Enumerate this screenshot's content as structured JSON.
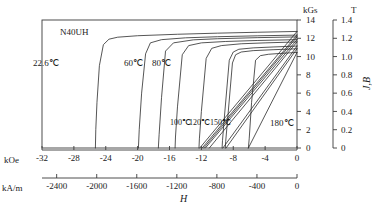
{
  "figure": {
    "sample_label": "N40UH",
    "x_axis_name": "H",
    "y_axis_name": "J,B",
    "unit_kgs": "kGs",
    "unit_tesla": "T",
    "unit_koe": "kOe",
    "unit_kam": "kA/m"
  },
  "axes": {
    "koe_ticks": [
      "-32",
      "-28",
      "-24",
      "-20",
      "-16",
      "-12",
      "-8",
      "-4",
      "0"
    ],
    "kam_ticks": [
      "-2400",
      "-2000",
      "-1600",
      "-1200",
      "-800",
      "-400",
      "0"
    ],
    "kgs_ticks": [
      "14",
      "12",
      "10",
      "8",
      "6",
      "4",
      "2",
      "0"
    ],
    "tesla_ticks": [
      "1.4",
      "1.2",
      "1.0",
      "0.8",
      "0.6",
      "0.4",
      "0.2",
      "0"
    ]
  },
  "curve_labels": [
    {
      "text": "22.6℃",
      "x": 33,
      "y": 59,
      "size": "big"
    },
    {
      "text": "60℃",
      "x": 124,
      "y": 59,
      "size": "big"
    },
    {
      "text": "80℃",
      "x": 152,
      "y": 59,
      "size": "big"
    },
    {
      "text": "100℃",
      "x": 170,
      "y": 119,
      "size": "small"
    },
    {
      "text": "120℃",
      "x": 189,
      "y": 119,
      "size": "small"
    },
    {
      "text": "150℃",
      "x": 210,
      "y": 119,
      "size": "small"
    },
    {
      "text": "180℃",
      "x": 270,
      "y": 119,
      "size": "big"
    }
  ],
  "chart_data": {
    "type": "line",
    "xlabel": "H",
    "ylabel": "J,B",
    "x_units": [
      "kOe",
      "kA/m"
    ],
    "y_units": [
      "kGs",
      "T"
    ],
    "xlim_koe": [
      -32,
      0
    ],
    "xlim_kam": [
      -2546,
      0
    ],
    "ylim_kgs": [
      0,
      14
    ],
    "ylim_tesla": [
      0,
      1.4
    ],
    "grid": false,
    "legend": "inline-annotations",
    "series": [
      {
        "name": "22.6℃ J",
        "kind": "J",
        "Br_kGs": 12.75,
        "Hcj_kOe": -25.3,
        "knee_kOe": -24.3,
        "points_koe_kgs": [
          [
            0,
            12.75
          ],
          [
            -5,
            12.66
          ],
          [
            -10,
            12.56
          ],
          [
            -15,
            12.44
          ],
          [
            -20,
            12.28
          ],
          [
            -22.5,
            12.12
          ],
          [
            -23.6,
            11.9
          ],
          [
            -24.3,
            11.3
          ],
          [
            -24.8,
            9.0
          ],
          [
            -25.1,
            5.0
          ],
          [
            -25.25,
            2.0
          ],
          [
            -25.3,
            0
          ]
        ]
      },
      {
        "name": "22.6℃ B",
        "kind": "B",
        "Br_kGs": 12.75,
        "Hcb_kOe": -12.2,
        "points_koe_kgs": [
          [
            0,
            12.75
          ],
          [
            -12.2,
            0
          ]
        ]
      },
      {
        "name": "60℃ J",
        "kind": "J",
        "Br_kGs": 12.35,
        "Hcj_kOe": -19.9,
        "knee_kOe": -19.0,
        "points_koe_kgs": [
          [
            0,
            12.35
          ],
          [
            -5,
            12.27
          ],
          [
            -10,
            12.17
          ],
          [
            -14,
            12.05
          ],
          [
            -17,
            11.85
          ],
          [
            -18.4,
            11.5
          ],
          [
            -19.0,
            10.3
          ],
          [
            -19.5,
            6.0
          ],
          [
            -19.8,
            2.0
          ],
          [
            -19.9,
            0
          ]
        ]
      },
      {
        "name": "60℃ B",
        "kind": "B",
        "Br_kGs": 12.35,
        "Hcb_kOe": -11.9,
        "points_koe_kgs": [
          [
            0,
            12.35
          ],
          [
            -11.9,
            0
          ]
        ]
      },
      {
        "name": "80℃ J",
        "kind": "J",
        "Br_kGs": 12.15,
        "Hcj_kOe": -17.4,
        "knee_kOe": -16.5,
        "points_koe_kgs": [
          [
            0,
            12.15
          ],
          [
            -5,
            12.07
          ],
          [
            -10,
            11.95
          ],
          [
            -13,
            11.83
          ],
          [
            -15.5,
            11.5
          ],
          [
            -16.5,
            10.6
          ],
          [
            -17.0,
            5.5
          ],
          [
            -17.3,
            1.5
          ],
          [
            -17.4,
            0
          ]
        ]
      },
      {
        "name": "80℃ B",
        "kind": "B",
        "Br_kGs": 12.15,
        "Hcb_kOe": -11.7,
        "points_koe_kgs": [
          [
            0,
            12.15
          ],
          [
            -11.7,
            0
          ]
        ]
      },
      {
        "name": "100℃ J",
        "kind": "J",
        "Br_kGs": 11.85,
        "Hcj_kOe": -15.3,
        "knee_kOe": -14.4,
        "points_koe_kgs": [
          [
            0,
            11.85
          ],
          [
            -5,
            11.76
          ],
          [
            -9,
            11.65
          ],
          [
            -12,
            11.5
          ],
          [
            -13.6,
            11.2
          ],
          [
            -14.4,
            10.2
          ],
          [
            -15.0,
            4.5
          ],
          [
            -15.25,
            1.2
          ],
          [
            -15.3,
            0
          ]
        ]
      },
      {
        "name": "100℃ B",
        "kind": "B",
        "Br_kGs": 11.85,
        "Hcb_kOe": -11.5,
        "points_koe_kgs": [
          [
            0,
            11.85
          ],
          [
            -11.5,
            0
          ]
        ]
      },
      {
        "name": "120℃ J",
        "kind": "J",
        "Br_kGs": 11.6,
        "Hcj_kOe": -12.3,
        "knee_kOe": -11.4,
        "points_koe_kgs": [
          [
            0,
            11.6
          ],
          [
            -4,
            11.5
          ],
          [
            -7,
            11.4
          ],
          [
            -9.5,
            11.2
          ],
          [
            -10.7,
            10.9
          ],
          [
            -11.4,
            9.8
          ],
          [
            -12.0,
            4.0
          ],
          [
            -12.25,
            1.0
          ],
          [
            -12.3,
            0
          ]
        ]
      },
      {
        "name": "120℃ B",
        "kind": "B",
        "Br_kGs": 11.6,
        "Hcb_kOe": -11.0,
        "points_koe_kgs": [
          [
            0,
            11.6
          ],
          [
            -11.0,
            0
          ]
        ]
      },
      {
        "name": "150℃ J",
        "kind": "J",
        "Br_kGs": 11.15,
        "Hcj_kOe": -9.4,
        "knee_kOe": -8.5,
        "points_koe_kgs": [
          [
            0,
            11.15
          ],
          [
            -3,
            11.05
          ],
          [
            -5.5,
            10.95
          ],
          [
            -7.3,
            10.8
          ],
          [
            -8.0,
            10.5
          ],
          [
            -8.5,
            9.6
          ],
          [
            -9.1,
            3.5
          ],
          [
            -9.35,
            0.8
          ],
          [
            -9.4,
            0
          ]
        ]
      },
      {
        "name": "150℃ B",
        "kind": "B",
        "Br_kGs": 11.15,
        "Hcb_kOe": -9.3,
        "points_koe_kgs": [
          [
            0,
            11.15
          ],
          [
            -9.3,
            0
          ]
        ]
      },
      {
        "name": "165℃ J",
        "kind": "J",
        "Br_kGs": 10.85,
        "Hcj_kOe": -9.0,
        "knee_kOe": -8.1,
        "points_koe_kgs": [
          [
            0,
            10.85
          ],
          [
            -3,
            10.75
          ],
          [
            -5.5,
            10.65
          ],
          [
            -7.0,
            10.5
          ],
          [
            -7.7,
            10.2
          ],
          [
            -8.1,
            9.3
          ],
          [
            -8.7,
            3.2
          ],
          [
            -8.95,
            0.7
          ],
          [
            -9.0,
            0
          ]
        ]
      },
      {
        "name": "165℃ B",
        "kind": "B",
        "Br_kGs": 10.85,
        "Hcb_kOe": -8.9,
        "points_koe_kgs": [
          [
            0,
            10.85
          ],
          [
            -8.9,
            0
          ]
        ]
      },
      {
        "name": "180℃ J",
        "kind": "J",
        "Br_kGs": 10.45,
        "Hcj_kOe": -6.1,
        "knee_kOe": -5.2,
        "points_koe_kgs": [
          [
            0,
            10.45
          ],
          [
            -2,
            10.35
          ],
          [
            -3.6,
            10.25
          ],
          [
            -4.6,
            10.1
          ],
          [
            -5.2,
            9.6
          ],
          [
            -5.7,
            5.0
          ],
          [
            -6.0,
            1.0
          ],
          [
            -6.1,
            0
          ]
        ]
      },
      {
        "name": "180℃ B",
        "kind": "B",
        "Br_kGs": 10.45,
        "Hcb_kOe": -6.1,
        "points_koe_kgs": [
          [
            0,
            10.45
          ],
          [
            -6.1,
            0
          ]
        ]
      }
    ]
  }
}
